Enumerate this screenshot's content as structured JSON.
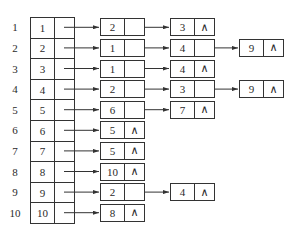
{
  "diagram": {
    "type": "adjacency-list",
    "null_symbol": "∧",
    "rows": [
      {
        "index": "1",
        "head": "1",
        "list": [
          "2",
          "3"
        ]
      },
      {
        "index": "2",
        "head": "2",
        "list": [
          "1",
          "4",
          "9"
        ]
      },
      {
        "index": "3",
        "head": "3",
        "list": [
          "1",
          "4"
        ]
      },
      {
        "index": "4",
        "head": "4",
        "list": [
          "2",
          "3",
          "9"
        ]
      },
      {
        "index": "5",
        "head": "5",
        "list": [
          "6",
          "7"
        ]
      },
      {
        "index": "6",
        "head": "6",
        "list": [
          "5"
        ]
      },
      {
        "index": "7",
        "head": "7",
        "list": [
          "5"
        ]
      },
      {
        "index": "8",
        "head": "8",
        "list": [
          "10"
        ]
      },
      {
        "index": "9",
        "head": "9",
        "list": [
          "2",
          "4"
        ]
      },
      {
        "index": "10",
        "head": "10",
        "list": [
          "8"
        ]
      }
    ]
  }
}
